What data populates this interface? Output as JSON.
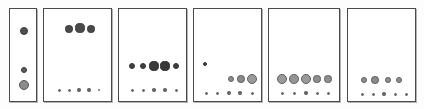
{
  "figure": {
    "title": "",
    "width": 424,
    "height": 109,
    "background_color": "#fdfdfd",
    "panel_border_color": "#4a4a4a",
    "panel_fill_color": "#ffffff",
    "dot_dark_color": "#4a4a4a",
    "dot_mid_color": "#8a8a8a",
    "dot_light_color": "#9a9a9a",
    "panel_count": 6
  },
  "panels": [
    {
      "name": "panel-1",
      "label": "",
      "x": 9,
      "y": 8,
      "width": 28,
      "height": 94,
      "dots": [
        {
          "cx": 14,
          "cy": 22,
          "r": 4.0,
          "fill": "#4f4f4f",
          "stroke": "#3a3a3a"
        },
        {
          "cx": 14,
          "cy": 61,
          "r": 3.2,
          "fill": "#5a5a5a",
          "stroke": "#3a3a3a"
        },
        {
          "cx": 14,
          "cy": 76,
          "r": 5.0,
          "fill": "#8b8b8b",
          "stroke": "#555555"
        }
      ]
    },
    {
      "name": "panel-2",
      "label": "",
      "x": 43,
      "y": 8,
      "width": 69,
      "height": 94,
      "dots": [
        {
          "cx": 25,
          "cy": 20,
          "r": 3.6,
          "fill": "#4a4a4a",
          "stroke": "#3a3a3a"
        },
        {
          "cx": 36,
          "cy": 19,
          "r": 4.6,
          "fill": "#4a4a4a",
          "stroke": "#3a3a3a"
        },
        {
          "cx": 47,
          "cy": 20,
          "r": 3.6,
          "fill": "#4a4a4a",
          "stroke": "#3a3a3a"
        },
        {
          "cx": 15,
          "cy": 81,
          "r": 1.5,
          "fill": "#6a6a6a",
          "stroke": "#5a5a5a"
        },
        {
          "cx": 25,
          "cy": 81,
          "r": 1.5,
          "fill": "#6a6a6a",
          "stroke": "#5a5a5a"
        },
        {
          "cx": 35,
          "cy": 81,
          "r": 1.6,
          "fill": "#6a6a6a",
          "stroke": "#5a5a5a"
        },
        {
          "cx": 45,
          "cy": 81,
          "r": 1.6,
          "fill": "#6a6a6a",
          "stroke": "#5a5a5a"
        },
        {
          "cx": 55,
          "cy": 81,
          "r": 1.4,
          "fill": "#6a6a6a",
          "stroke": "#5a5a5a"
        }
      ]
    },
    {
      "name": "panel-3",
      "label": "",
      "x": 118,
      "y": 8,
      "width": 69,
      "height": 94,
      "dots": [
        {
          "cx": 13,
          "cy": 57,
          "r": 3.4,
          "fill": "#3f3f3f",
          "stroke": "#333333"
        },
        {
          "cx": 24,
          "cy": 57,
          "r": 3.4,
          "fill": "#3f3f3f",
          "stroke": "#333333"
        },
        {
          "cx": 35,
          "cy": 57,
          "r": 4.6,
          "fill": "#3a3a3a",
          "stroke": "#2f2f2f"
        },
        {
          "cx": 46,
          "cy": 57,
          "r": 4.6,
          "fill": "#3a3a3a",
          "stroke": "#2f2f2f"
        },
        {
          "cx": 57,
          "cy": 57,
          "r": 3.4,
          "fill": "#3f3f3f",
          "stroke": "#333333"
        },
        {
          "cx": 13,
          "cy": 81,
          "r": 1.5,
          "fill": "#6a6a6a",
          "stroke": "#5a5a5a"
        },
        {
          "cx": 24,
          "cy": 81,
          "r": 1.5,
          "fill": "#6a6a6a",
          "stroke": "#5a5a5a"
        },
        {
          "cx": 35,
          "cy": 81,
          "r": 1.6,
          "fill": "#6a6a6a",
          "stroke": "#5a5a5a"
        },
        {
          "cx": 46,
          "cy": 81,
          "r": 1.6,
          "fill": "#6a6a6a",
          "stroke": "#5a5a5a"
        },
        {
          "cx": 57,
          "cy": 81,
          "r": 1.5,
          "fill": "#6a6a6a",
          "stroke": "#5a5a5a"
        }
      ]
    },
    {
      "name": "panel-4",
      "label": "",
      "x": 193,
      "y": 8,
      "width": 69,
      "height": 94,
      "dots": [
        {
          "cx": 11,
          "cy": 55,
          "r": 2.2,
          "fill": "#3f3f3f",
          "stroke": "#333333"
        },
        {
          "cx": 37,
          "cy": 70,
          "r": 3.0,
          "fill": "#8d8d8d",
          "stroke": "#5f5f5f"
        },
        {
          "cx": 47,
          "cy": 70,
          "r": 3.8,
          "fill": "#8a8a8a",
          "stroke": "#5a5a5a"
        },
        {
          "cx": 58,
          "cy": 70,
          "r": 5.0,
          "fill": "#9a9a9a",
          "stroke": "#606060"
        },
        {
          "cx": 12,
          "cy": 84,
          "r": 1.5,
          "fill": "#6a6a6a",
          "stroke": "#5a5a5a"
        },
        {
          "cx": 23,
          "cy": 84,
          "r": 1.5,
          "fill": "#6a6a6a",
          "stroke": "#5a5a5a"
        },
        {
          "cx": 35,
          "cy": 84,
          "r": 1.6,
          "fill": "#6a6a6a",
          "stroke": "#5a5a5a"
        },
        {
          "cx": 46,
          "cy": 84,
          "r": 1.6,
          "fill": "#6a6a6a",
          "stroke": "#5a5a5a"
        },
        {
          "cx": 58,
          "cy": 84,
          "r": 1.5,
          "fill": "#6a6a6a",
          "stroke": "#5a5a5a"
        }
      ]
    },
    {
      "name": "panel-5",
      "label": "",
      "x": 268,
      "y": 8,
      "width": 72,
      "height": 94,
      "dots": [
        {
          "cx": 13,
          "cy": 70,
          "r": 5.0,
          "fill": "#9a9a9a",
          "stroke": "#5e5e5e"
        },
        {
          "cx": 25,
          "cy": 70,
          "r": 4.8,
          "fill": "#949494",
          "stroke": "#5e5e5e"
        },
        {
          "cx": 37,
          "cy": 70,
          "r": 5.2,
          "fill": "#9a9a9a",
          "stroke": "#5e5e5e"
        },
        {
          "cx": 48,
          "cy": 70,
          "r": 3.6,
          "fill": "#8e8e8e",
          "stroke": "#5e5e5e"
        },
        {
          "cx": 59,
          "cy": 70,
          "r": 3.6,
          "fill": "#8e8e8e",
          "stroke": "#5e5e5e"
        },
        {
          "cx": 13,
          "cy": 84,
          "r": 1.5,
          "fill": "#6a6a6a",
          "stroke": "#5a5a5a"
        },
        {
          "cx": 25,
          "cy": 84,
          "r": 1.5,
          "fill": "#6a6a6a",
          "stroke": "#5a5a5a"
        },
        {
          "cx": 37,
          "cy": 84,
          "r": 1.6,
          "fill": "#6a6a6a",
          "stroke": "#5a5a5a"
        },
        {
          "cx": 48,
          "cy": 84,
          "r": 1.5,
          "fill": "#6a6a6a",
          "stroke": "#5a5a5a"
        },
        {
          "cx": 59,
          "cy": 84,
          "r": 1.5,
          "fill": "#6a6a6a",
          "stroke": "#5a5a5a"
        }
      ]
    },
    {
      "name": "panel-6",
      "label": "",
      "x": 347,
      "y": 8,
      "width": 69,
      "height": 94,
      "dots": [
        {
          "cx": 16,
          "cy": 71,
          "r": 3.4,
          "fill": "#8e8e8e",
          "stroke": "#5e5e5e"
        },
        {
          "cx": 27,
          "cy": 71,
          "r": 3.8,
          "fill": "#8a8a8a",
          "stroke": "#5a5a5a"
        },
        {
          "cx": 40,
          "cy": 71,
          "r": 2.8,
          "fill": "#8e8e8e",
          "stroke": "#5e5e5e"
        },
        {
          "cx": 51,
          "cy": 71,
          "r": 3.2,
          "fill": "#8e8e8e",
          "stroke": "#5e5e5e"
        },
        {
          "cx": 14,
          "cy": 85,
          "r": 1.5,
          "fill": "#6a6a6a",
          "stroke": "#5a5a5a"
        },
        {
          "cx": 25,
          "cy": 85,
          "r": 1.5,
          "fill": "#6a6a6a",
          "stroke": "#5a5a5a"
        },
        {
          "cx": 36,
          "cy": 85,
          "r": 1.6,
          "fill": "#6a6a6a",
          "stroke": "#5a5a5a"
        },
        {
          "cx": 47,
          "cy": 85,
          "r": 1.5,
          "fill": "#6a6a6a",
          "stroke": "#5a5a5a"
        },
        {
          "cx": 58,
          "cy": 85,
          "r": 1.5,
          "fill": "#6a6a6a",
          "stroke": "#5a5a5a"
        }
      ]
    }
  ]
}
